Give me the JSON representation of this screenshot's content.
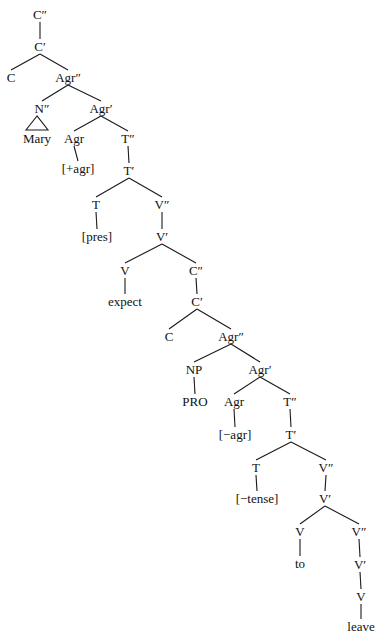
{
  "diagram": {
    "type": "syntax-tree",
    "nodes": [
      {
        "id": "n0",
        "label": "C″",
        "x": 40,
        "y": 8
      },
      {
        "id": "n1",
        "label": "C′",
        "x": 40,
        "y": 40
      },
      {
        "id": "n2",
        "label": "C",
        "x": 11,
        "y": 71
      },
      {
        "id": "n3",
        "label": "Agr″",
        "x": 68,
        "y": 71
      },
      {
        "id": "n4",
        "label": "N″",
        "x": 42,
        "y": 102
      },
      {
        "id": "n5",
        "label": "Agr′",
        "x": 101,
        "y": 102
      },
      {
        "id": "n6",
        "label": "Mary",
        "x": 37,
        "y": 132
      },
      {
        "id": "n7",
        "label": "Agr",
        "x": 74,
        "y": 132
      },
      {
        "id": "n8",
        "label": "T″",
        "x": 128,
        "y": 132
      },
      {
        "id": "n9",
        "label": "[+agr]",
        "x": 78,
        "y": 162
      },
      {
        "id": "n10",
        "label": "T′",
        "x": 129,
        "y": 164
      },
      {
        "id": "n11",
        "label": "T",
        "x": 96,
        "y": 198
      },
      {
        "id": "n12",
        "label": "V″",
        "x": 162,
        "y": 198
      },
      {
        "id": "n13",
        "label": "[pres]",
        "x": 97,
        "y": 230
      },
      {
        "id": "n14",
        "label": "V′",
        "x": 162,
        "y": 230
      },
      {
        "id": "n15",
        "label": "V",
        "x": 125,
        "y": 264
      },
      {
        "id": "n16",
        "label": "C″",
        "x": 196,
        "y": 264
      },
      {
        "id": "n17",
        "label": "expect",
        "x": 125,
        "y": 295
      },
      {
        "id": "n18",
        "label": "C′",
        "x": 197,
        "y": 295
      },
      {
        "id": "n19",
        "label": "C",
        "x": 169,
        "y": 330
      },
      {
        "id": "n20",
        "label": "Agr″",
        "x": 231,
        "y": 330
      },
      {
        "id": "n21",
        "label": "NP",
        "x": 194,
        "y": 363
      },
      {
        "id": "n22",
        "label": "Agr′",
        "x": 260,
        "y": 363
      },
      {
        "id": "n23",
        "label": "PRO",
        "x": 195,
        "y": 395
      },
      {
        "id": "n24",
        "label": "Agr",
        "x": 234,
        "y": 395
      },
      {
        "id": "n25",
        "label": "T″",
        "x": 290,
        "y": 395
      },
      {
        "id": "n26",
        "label": "[−agr]",
        "x": 235,
        "y": 428
      },
      {
        "id": "n27",
        "label": "T′",
        "x": 291,
        "y": 428
      },
      {
        "id": "n28",
        "label": "T",
        "x": 256,
        "y": 461
      },
      {
        "id": "n29",
        "label": "V″",
        "x": 326,
        "y": 461
      },
      {
        "id": "n30",
        "label": "[−tense]",
        "x": 257,
        "y": 492
      },
      {
        "id": "n31",
        "label": "V′",
        "x": 325,
        "y": 492
      },
      {
        "id": "n32",
        "label": "V",
        "x": 300,
        "y": 525
      },
      {
        "id": "n33",
        "label": "V″",
        "x": 359,
        "y": 525
      },
      {
        "id": "n34",
        "label": "to",
        "x": 300,
        "y": 557
      },
      {
        "id": "n35",
        "label": "V′",
        "x": 360,
        "y": 558
      },
      {
        "id": "n36",
        "label": "V",
        "x": 361,
        "y": 590
      },
      {
        "id": "n37",
        "label": "leave",
        "x": 361,
        "y": 620
      }
    ],
    "edges": [
      [
        "n0",
        "n1"
      ],
      [
        "n1",
        "n2"
      ],
      [
        "n1",
        "n3"
      ],
      [
        "n3",
        "n4"
      ],
      [
        "n3",
        "n5"
      ],
      [
        "n5",
        "n7"
      ],
      [
        "n5",
        "n8"
      ],
      [
        "n7",
        "n9"
      ],
      [
        "n8",
        "n10"
      ],
      [
        "n10",
        "n11"
      ],
      [
        "n10",
        "n12"
      ],
      [
        "n11",
        "n13"
      ],
      [
        "n12",
        "n14"
      ],
      [
        "n14",
        "n15"
      ],
      [
        "n14",
        "n16"
      ],
      [
        "n15",
        "n17"
      ],
      [
        "n16",
        "n18"
      ],
      [
        "n18",
        "n19"
      ],
      [
        "n18",
        "n20"
      ],
      [
        "n20",
        "n21"
      ],
      [
        "n20",
        "n22"
      ],
      [
        "n21",
        "n23"
      ],
      [
        "n22",
        "n24"
      ],
      [
        "n22",
        "n25"
      ],
      [
        "n24",
        "n26"
      ],
      [
        "n25",
        "n27"
      ],
      [
        "n27",
        "n28"
      ],
      [
        "n27",
        "n29"
      ],
      [
        "n28",
        "n30"
      ],
      [
        "n29",
        "n31"
      ],
      [
        "n31",
        "n32"
      ],
      [
        "n31",
        "n33"
      ],
      [
        "n32",
        "n34"
      ],
      [
        "n33",
        "n35"
      ],
      [
        "n35",
        "n36"
      ],
      [
        "n36",
        "n37"
      ]
    ],
    "triangles": [
      {
        "parent": "n4",
        "child": "n6",
        "left": 26,
        "right": 48,
        "top": 116,
        "bottom": 130
      }
    ]
  }
}
